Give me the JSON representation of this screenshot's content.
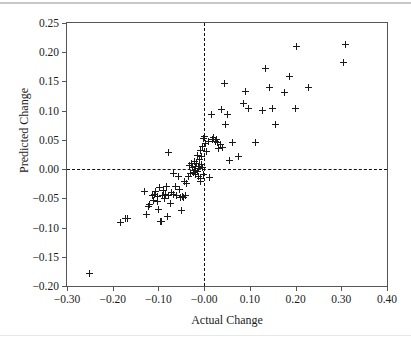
{
  "chart_data": {
    "type": "scatter",
    "title": "",
    "xlabel": "Actual Change",
    "ylabel": "Predicted Change",
    "xlim": [
      -0.3,
      0.4
    ],
    "ylim": [
      -0.2,
      0.25
    ],
    "xticks": [
      -0.3,
      -0.2,
      -0.1,
      -0.0,
      0.1,
      0.2,
      0.3,
      0.4
    ],
    "yticks": [
      -0.2,
      -0.15,
      -0.1,
      -0.05,
      0.0,
      0.05,
      0.1,
      0.15,
      0.2,
      0.25
    ],
    "xticklabels": [
      "-0.30",
      "-0.20",
      "-0.10",
      "-0.00",
      "0.10",
      "0.20",
      "0.30",
      "0.40"
    ],
    "yticklabels": [
      "-0.20",
      "-0.15",
      "-0.10",
      "-0.05",
      "0.00",
      "0.05",
      "0.10",
      "0.15",
      "0.20",
      "0.25"
    ],
    "grid": false,
    "legend": null,
    "marker": "plus",
    "marker_color": "#1a1a1a",
    "reference_lines": [
      {
        "orientation": "vertical",
        "value": 0.0,
        "style": "dashed",
        "color": "#111111"
      },
      {
        "orientation": "horizontal",
        "value": 0.0,
        "style": "dashed",
        "color": "#111111"
      }
    ],
    "points": [
      [
        -0.251,
        -0.178
      ],
      [
        -0.182,
        -0.091
      ],
      [
        -0.173,
        -0.085
      ],
      [
        -0.168,
        -0.084
      ],
      [
        -0.131,
        -0.039
      ],
      [
        -0.127,
        -0.078
      ],
      [
        -0.121,
        -0.064
      ],
      [
        -0.119,
        -0.06
      ],
      [
        -0.113,
        -0.046
      ],
      [
        -0.111,
        -0.053
      ],
      [
        -0.108,
        -0.044
      ],
      [
        -0.106,
        -0.038
      ],
      [
        -0.103,
        -0.047
      ],
      [
        -0.101,
        -0.056
      ],
      [
        -0.099,
        -0.069
      ],
      [
        -0.097,
        -0.031
      ],
      [
        -0.095,
        -0.09
      ],
      [
        -0.093,
        -0.089
      ],
      [
        -0.091,
        -0.046
      ],
      [
        -0.089,
        -0.036
      ],
      [
        -0.087,
        -0.05
      ],
      [
        -0.085,
        -0.044
      ],
      [
        -0.083,
        -0.029
      ],
      [
        -0.081,
        -0.081
      ],
      [
        -0.079,
        0.029
      ],
      [
        -0.077,
        -0.046
      ],
      [
        -0.074,
        -0.058
      ],
      [
        -0.071,
        -0.04
      ],
      [
        -0.068,
        -0.007
      ],
      [
        -0.066,
        -0.043
      ],
      [
        -0.063,
        -0.03
      ],
      [
        -0.06,
        -0.045
      ],
      [
        -0.057,
        -0.013
      ],
      [
        -0.054,
        -0.035
      ],
      [
        -0.051,
        -0.049
      ],
      [
        -0.049,
        -0.07
      ],
      [
        -0.047,
        -0.047
      ],
      [
        -0.045,
        -0.048
      ],
      [
        -0.043,
        -0.022
      ],
      [
        -0.041,
        -0.046
      ],
      [
        -0.038,
        -0.024
      ],
      [
        -0.035,
        -0.013
      ],
      [
        -0.032,
        0.006
      ],
      [
        -0.03,
        -0.008
      ],
      [
        -0.028,
        0.01
      ],
      [
        -0.026,
        0.002
      ],
      [
        -0.024,
        -0.006
      ],
      [
        -0.022,
        0.013
      ],
      [
        -0.021,
        -0.002
      ],
      [
        -0.02,
        0.005
      ],
      [
        -0.018,
        -0.01
      ],
      [
        -0.017,
        0.009
      ],
      [
        -0.015,
        -0.004
      ],
      [
        -0.014,
        0.024
      ],
      [
        -0.013,
        0.001
      ],
      [
        -0.012,
        -0.012
      ],
      [
        -0.011,
        0.016
      ],
      [
        -0.01,
        0.004
      ],
      [
        -0.009,
        -0.021
      ],
      [
        -0.008,
        0.031
      ],
      [
        -0.007,
        -0.016
      ],
      [
        -0.006,
        0.008
      ],
      [
        -0.005,
        0.021
      ],
      [
        -0.004,
        0.039
      ],
      [
        -0.003,
        0.003
      ],
      [
        -0.002,
        -0.009
      ],
      [
        -0.001,
        0.052
      ],
      [
        0.001,
        0.056
      ],
      [
        0.003,
        0.044
      ],
      [
        0.006,
        0.03
      ],
      [
        0.009,
        0.048
      ],
      [
        0.012,
        -0.014
      ],
      [
        0.016,
        0.093
      ],
      [
        0.019,
        0.05
      ],
      [
        0.021,
        0.054
      ],
      [
        0.024,
        0.047
      ],
      [
        0.027,
        0.051
      ],
      [
        0.029,
        0.046
      ],
      [
        0.032,
        0.036
      ],
      [
        0.035,
        0.042
      ],
      [
        0.038,
        0.102
      ],
      [
        0.041,
        0.037
      ],
      [
        0.044,
        0.146
      ],
      [
        0.047,
        0.077
      ],
      [
        0.05,
        0.094
      ],
      [
        0.056,
        0.015
      ],
      [
        0.063,
        0.046
      ],
      [
        0.076,
        0.022
      ],
      [
        0.085,
        0.112
      ],
      [
        0.09,
        0.133
      ],
      [
        0.096,
        0.103
      ],
      [
        0.113,
        0.045
      ],
      [
        0.127,
        0.1
      ],
      [
        0.135,
        0.172
      ],
      [
        0.142,
        0.139
      ],
      [
        0.15,
        0.103
      ],
      [
        0.156,
        0.076
      ],
      [
        0.176,
        0.131
      ],
      [
        0.186,
        0.159
      ],
      [
        0.199,
        0.103
      ],
      [
        0.203,
        0.21
      ],
      [
        0.228,
        0.14
      ],
      [
        0.305,
        0.182
      ],
      [
        0.31,
        0.213
      ]
    ]
  }
}
